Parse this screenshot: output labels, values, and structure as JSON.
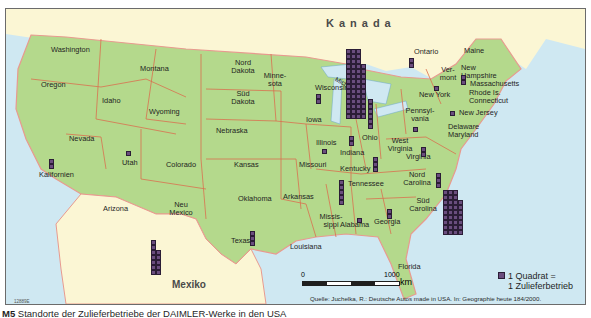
{
  "map": {
    "title_caption": {
      "number": "M5",
      "text": "Standorte der Zulieferbetriebe der DAIMLER-Werke in den USA"
    },
    "colors": {
      "water": "#cfe8f2",
      "usa_land": "#b4d98c",
      "foreign_land": "#fbf6d4",
      "state_border": "#d9704f",
      "national_border": "#e89a8f",
      "square_fill": "#6a4d7e"
    },
    "countries": {
      "canada": "Kanada",
      "mexico": "Mexiko"
    },
    "states": [
      {
        "name": "Washington"
      },
      {
        "name": "Oregon"
      },
      {
        "name": "Kalifornien"
      },
      {
        "name": "Nevada"
      },
      {
        "name": "Idaho"
      },
      {
        "name": "Montana"
      },
      {
        "name": "Wyoming"
      },
      {
        "name": "Utah"
      },
      {
        "name": "Arizona"
      },
      {
        "name": "Colorado"
      },
      {
        "name": "Neu Mexico"
      },
      {
        "name": "Nord Dakota"
      },
      {
        "name": "Süd Dakota"
      },
      {
        "name": "Nebraska"
      },
      {
        "name": "Kansas"
      },
      {
        "name": "Oklahoma"
      },
      {
        "name": "Texas"
      },
      {
        "name": "Minne-sota"
      },
      {
        "name": "Iowa"
      },
      {
        "name": "Missouri"
      },
      {
        "name": "Arkansas"
      },
      {
        "name": "Louisiana"
      },
      {
        "name": "Wisconsin"
      },
      {
        "name": "Illinois"
      },
      {
        "name": "Michigan"
      },
      {
        "name": "Indiana"
      },
      {
        "name": "Ohio"
      },
      {
        "name": "Kentucky"
      },
      {
        "name": "Tennessee"
      },
      {
        "name": "Missis-sippi"
      },
      {
        "name": "Alabama"
      },
      {
        "name": "Georgia"
      },
      {
        "name": "Florida"
      },
      {
        "name": "Süd Carolina"
      },
      {
        "name": "Nord Carolina"
      },
      {
        "name": "Virginia"
      },
      {
        "name": "West Virginia"
      },
      {
        "name": "Pennsyl-vania"
      },
      {
        "name": "New York"
      },
      {
        "name": "Ver-mont"
      },
      {
        "name": "New Hampshire"
      },
      {
        "name": "Maine"
      },
      {
        "name": "Massachusetts"
      },
      {
        "name": "Rhode Is. Connecticut"
      },
      {
        "name": "New Jersey"
      },
      {
        "name": "Delaware Maryland"
      },
      {
        "name": "Ontario"
      }
    ],
    "supplier_counts": [
      {
        "region": "Michigan",
        "count": 60
      },
      {
        "region": "Süd Carolina",
        "count": 35
      },
      {
        "region": "Mexiko",
        "count": 16
      },
      {
        "region": "Ohio",
        "count": 6
      },
      {
        "region": "Tennessee",
        "count": 5
      },
      {
        "region": "Kentucky",
        "count": 3
      },
      {
        "region": "Nord Carolina",
        "count": 3
      },
      {
        "region": "Texas",
        "count": 3
      },
      {
        "region": "Wisconsin",
        "count": 2
      },
      {
        "region": "Indiana",
        "count": 2
      },
      {
        "region": "Kalifornien",
        "count": 2
      },
      {
        "region": "Virginia",
        "count": 2
      },
      {
        "region": "Georgia",
        "count": 2
      },
      {
        "region": "Ontario",
        "count": 2
      },
      {
        "region": "Massachusetts",
        "count": 2
      },
      {
        "region": "Illinois",
        "count": 1
      },
      {
        "region": "Utah",
        "count": 1
      },
      {
        "region": "Alabama",
        "count": 1
      },
      {
        "region": "Pennsylvania",
        "count": 1
      },
      {
        "region": "New Jersey",
        "count": 1
      },
      {
        "region": "New York",
        "count": 1
      }
    ],
    "legend": {
      "line1": "1 Quadrat =",
      "line2": "1 Zulieferbetrieb"
    },
    "scale": {
      "start": "0",
      "end": "1000",
      "unit": "km"
    },
    "source": "Quelle: Juchelka, R.: Deutsche Autos made in USA. In: Geographie heute 184/2000.",
    "code": "12889E"
  }
}
